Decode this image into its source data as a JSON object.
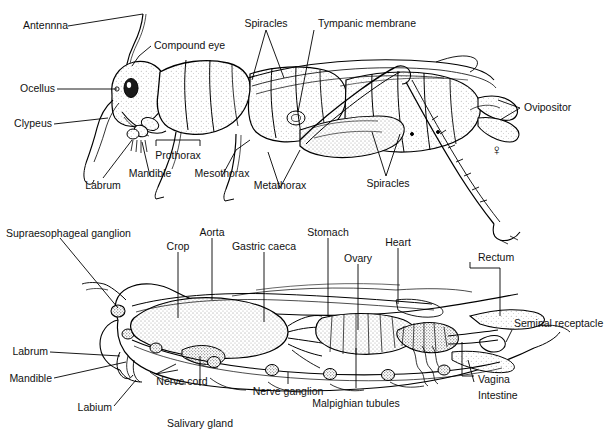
{
  "figure": {
    "background_color": "#ffffff",
    "ink_color": "#000000",
    "panels": [
      {
        "name": "external-anatomy",
        "caption": "",
        "sex_symbol": "♀",
        "labels": [
          "Antennna",
          "Compound eye",
          "Ocellus",
          "Clypeus",
          "Labrum",
          "Mandible",
          "Prothorax",
          "Mesothorax",
          "Metathorax",
          "Spiracles",
          "Tympanic membrane",
          "Spiracles",
          "Ovipositor"
        ]
      },
      {
        "name": "internal-anatomy",
        "caption": "",
        "labels": [
          "Supraesophageal ganglion",
          "Crop",
          "Aorta",
          "Gastric caeca",
          "Stomach",
          "Ovary",
          "Heart",
          "Rectum",
          "Seminal receptacle",
          "Vagina",
          "Intestine",
          "Malpighian tubules",
          "Nerve ganglion",
          "Salivary gland",
          "Labium",
          "Mandible",
          "Labrum",
          "Nerve cord"
        ]
      }
    ]
  },
  "top": {
    "antenna": "Antennna",
    "compound_eye": "Compound eye",
    "ocellus": "Ocellus",
    "clypeus": "Clypeus",
    "labrum": "Labrum",
    "mandible": "Mandible",
    "prothorax": "Prothorax",
    "mesothorax": "Mesothorax",
    "metathorax": "Metathorax",
    "spiracles_upper": "Spiracles",
    "tympanic_membrane": "Tympanic membrane",
    "spiracles_lower": "Spiracles",
    "ovipositor": "Ovipositor",
    "female_symbol": "♀"
  },
  "bottom": {
    "supraesophageal_ganglion": "Supraesophageal ganglion",
    "crop": "Crop",
    "aorta": "Aorta",
    "gastric_caeca": "Gastric caeca",
    "stomach": "Stomach",
    "ovary": "Ovary",
    "heart": "Heart",
    "rectum": "Rectum",
    "seminal_receptacle": "Seminal receptacle",
    "vagina": "Vagina",
    "intestine": "Intestine",
    "malpighian_tubules": "Malpighian tubules",
    "nerve_ganglion": "Nerve ganglion",
    "salivary_gland": "Salivary gland",
    "labium": "Labium",
    "mandible": "Mandible",
    "labrum": "Labrum",
    "nerve_cord": "Nerve cord"
  }
}
